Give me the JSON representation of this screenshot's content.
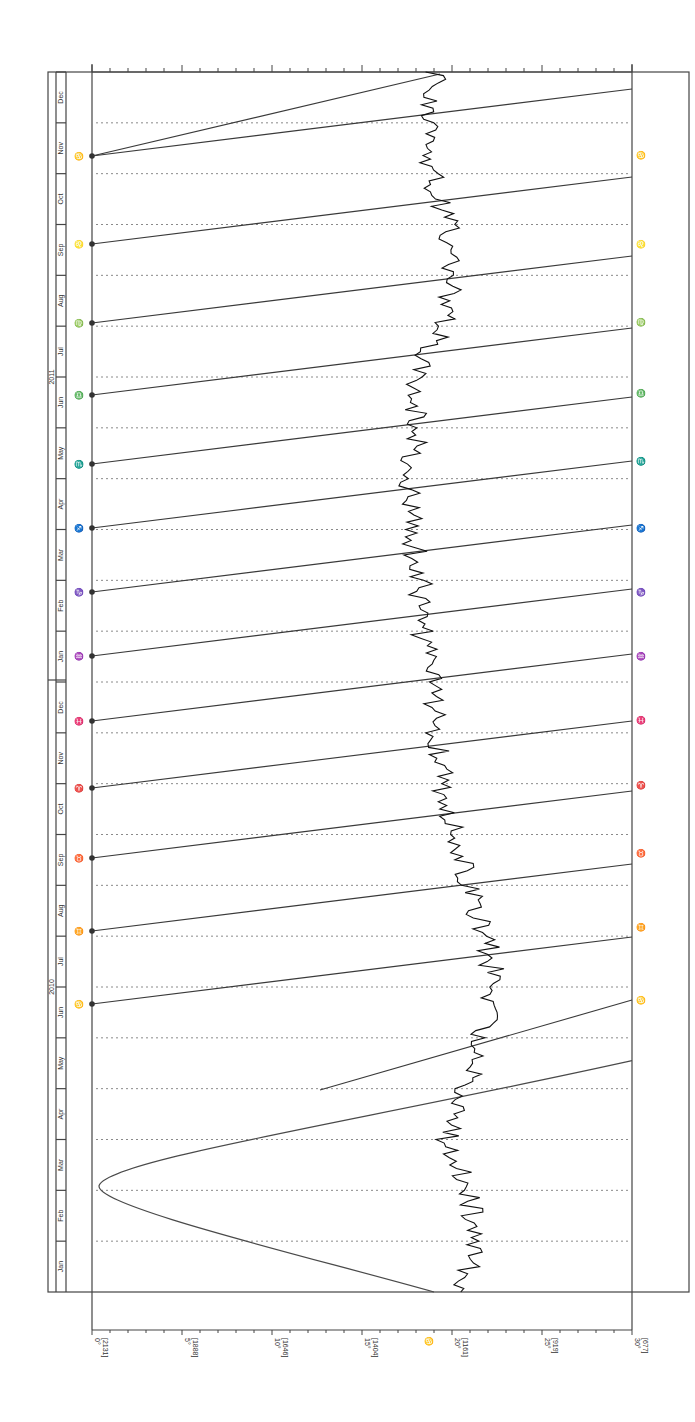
{
  "header": {
    "title_fragment": "………………"
  },
  "chart_data": {
    "type": "line",
    "orientation": "rotated-90-ccw",
    "xlabel": "Degrees of sign (declination scale in brackets)",
    "ylabel": "Date",
    "x_ticks": [
      {
        "deg": "0°",
        "sub": "[2131]"
      },
      {
        "deg": "5°",
        "sub": "[1888]"
      },
      {
        "deg": "10°",
        "sub": "[1646]"
      },
      {
        "deg": "15°",
        "sub": "[1404]"
      },
      {
        "deg": "20°",
        "sub": "[1161]"
      },
      {
        "deg": "25°",
        "sub": "[919]"
      },
      {
        "deg": "30°",
        "sub": "[677]"
      }
    ],
    "xlim": [
      0,
      30
    ],
    "years": [
      "2010",
      "2011"
    ],
    "months_2010": [
      "Jan",
      "Feb",
      "Mar",
      "Apr",
      "May",
      "Jun",
      "Jul",
      "Aug",
      "Sep",
      "Oct",
      "Nov",
      "Dec"
    ],
    "months_2011": [
      "Jan",
      "Feb",
      "Mar",
      "Apr",
      "May",
      "Jun",
      "Jul",
      "Aug",
      "Sep",
      "Oct",
      "Nov",
      "Dec"
    ],
    "grid": "dotted horizontal at month boundaries",
    "series": [
      {
        "name": "slow planet track (zigzag)",
        "description": "Near-vertical jagged line starting ~20.5° (Jan 2010) rising to ~22° around Feb/Jul 2010, drifting back to ~17–18° by Jun 2011 and ~19° by Dec 2011",
        "values_deg_by_month": [
          20.5,
          21.5,
          20.8,
          19.7,
          20.8,
          21.5,
          22.5,
          21.8,
          21.0,
          20.3,
          19.5,
          19.2,
          18.8,
          18.3,
          18.2,
          17.8,
          17.6,
          18.2,
          17.8,
          19.5,
          20.0,
          19.8,
          18.8,
          19.0
        ]
      },
      {
        "name": "fast planet track (parabola)",
        "description": "Retrograde loop: starts ~19° Jan 2010, reaches ~0.5° near early Mar 2010, returns to 30° by early May 2010",
        "values_deg": [
          [
            0.0,
            19.0
          ],
          [
            1.0,
            13.0
          ],
          [
            1.5,
            6.0
          ],
          [
            2.0,
            0.5
          ],
          [
            2.5,
            6.0
          ],
          [
            3.0,
            16.0
          ],
          [
            3.6,
            30.0
          ]
        ]
      },
      {
        "name": "sign ingress lines",
        "left_glyphs": [
          "♋",
          "♌",
          "♍",
          "♎",
          "♏",
          "♐",
          "♑",
          "♒",
          "♓",
          "♈",
          "♉",
          "♊",
          "♋",
          "♌",
          "♍"
        ],
        "right_glyphs": [
          "♋",
          "♌",
          "♍",
          "♎",
          "♏",
          "♐",
          "♑",
          "♒",
          "♓",
          "♈",
          "♉",
          "♊",
          "♋",
          "♌"
        ]
      }
    ],
    "markers": {
      "bottom_start_glyph": "♋",
      "left_glyphs_prefix": "☽"
    }
  }
}
